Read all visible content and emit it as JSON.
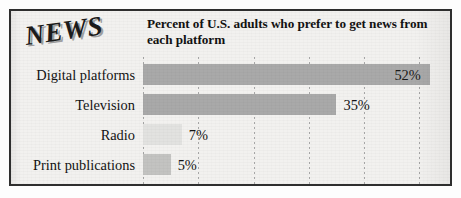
{
  "graphic": {
    "logo_text": "NEWS",
    "title": "Percent of U.S. adults who prefer to get news from each platform",
    "title_line_1": "Percent of U.S. adults who prefer to get",
    "title_line_2": "news from each platform",
    "frame_color": "#2e2e2e",
    "background_color": "#f2f1ef",
    "gridline_color": "#9a9a9a"
  },
  "chart_data": {
    "type": "bar",
    "orientation": "horizontal",
    "title": "Percent of U.S. adults who prefer to get news from each platform",
    "xlabel": "",
    "ylabel": "",
    "xlim": [
      0,
      55
    ],
    "grid": true,
    "legend": false,
    "unit": "%",
    "categories": [
      "Digital platforms",
      "Television",
      "Radio",
      "Print publications"
    ],
    "values": [
      52,
      35,
      7,
      5
    ],
    "value_labels": [
      "52%",
      "35%",
      "7%",
      "5%"
    ],
    "label_placement": [
      "inside",
      "outside",
      "outside",
      "outside"
    ],
    "bar_colors": [
      "#a9a9a9",
      "#a9a9a9",
      "#e2e2e0",
      "#c3c3c1"
    ],
    "gridline_percents": [
      0,
      10,
      20,
      30,
      40,
      50
    ]
  }
}
